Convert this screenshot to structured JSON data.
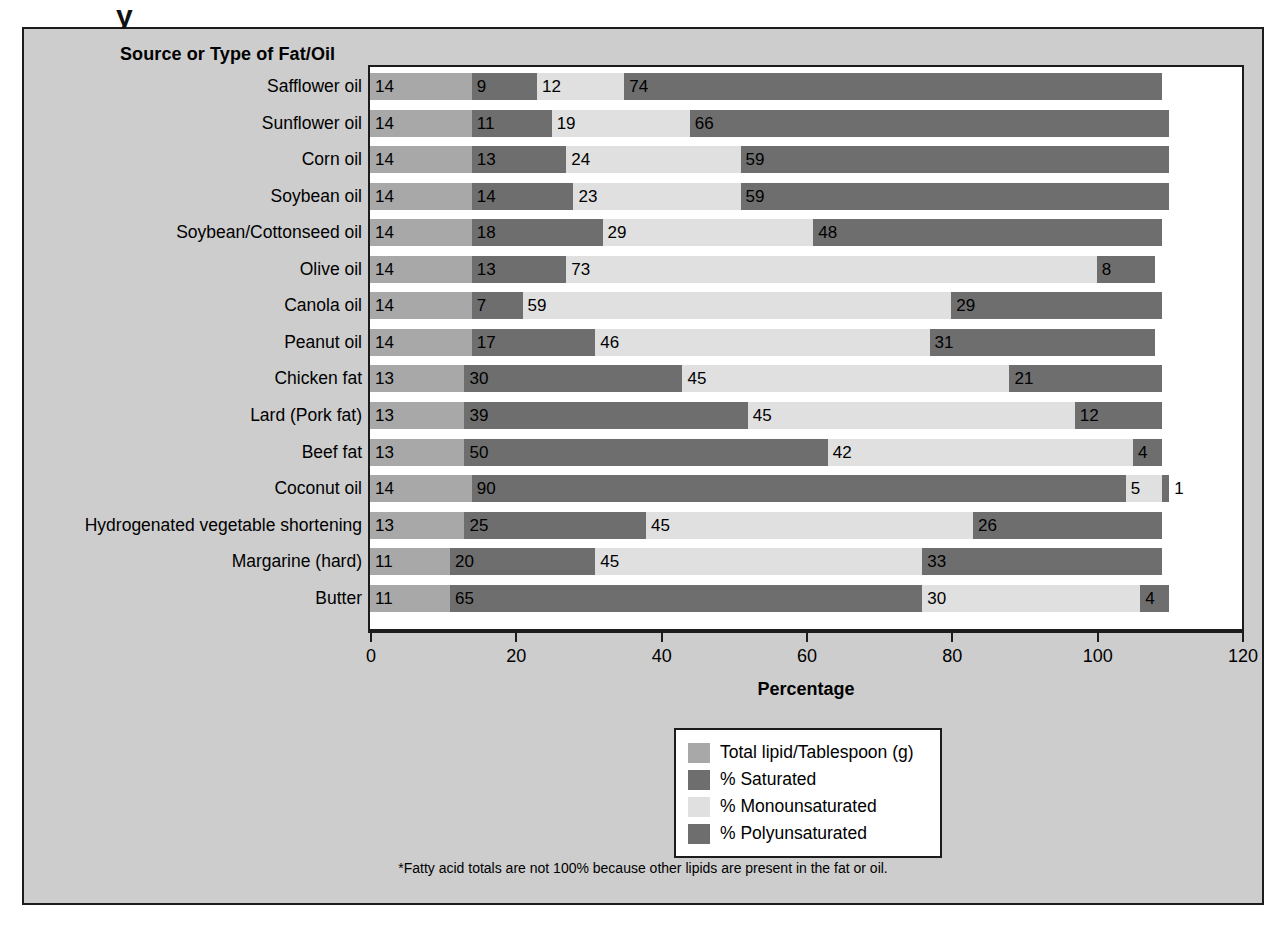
{
  "figure": {
    "column_header": "Source or Type of Fat/Oil",
    "footnote": "*Fatty acid totals are not 100% because other lipids are present in the fat or oil.",
    "title_cut_glyph": "y"
  },
  "legend": {
    "position": "bottom-center",
    "items": [
      {
        "label": "Total lipid/Tablespoon (g)",
        "color": "#a8a8a8",
        "key": "total"
      },
      {
        "label": "% Saturated",
        "color": "#6e6e6e",
        "key": "saturated"
      },
      {
        "label": "% Monounsaturated",
        "color": "#e0e0e0",
        "key": "monounsaturated"
      },
      {
        "label": "% Polyunsaturated",
        "color": "#6e6e6e",
        "key": "polyunsaturated"
      }
    ]
  },
  "colors": {
    "total": "#a8a8a8",
    "saturated": "#6e6e6e",
    "monounsaturated": "#e0e0e0",
    "polyunsaturated": "#6e6e6e",
    "panel_background": "#cdcdcd",
    "plot_background": "#ffffff",
    "frame": "#1c1c1c"
  },
  "chart_data": {
    "type": "bar",
    "orientation": "horizontal",
    "stacked": true,
    "title": "",
    "xlabel": "Percentage",
    "ylabel": "Source or Type of Fat/Oil",
    "xlim": [
      0,
      120
    ],
    "xticks": [
      0,
      20,
      40,
      60,
      80,
      100,
      120
    ],
    "grid": false,
    "legend_position": "bottom-center",
    "categories": [
      "Safflower oil",
      "Sunflower oil",
      "Corn oil",
      "Soybean oil",
      "Soybean/Cottonseed oil",
      "Olive oil",
      "Canola oil",
      "Peanut oil",
      "Chicken fat",
      "Lard (Pork fat)",
      "Beef fat",
      "Coconut oil",
      "Hydrogenated vegetable shortening",
      "Margarine (hard)",
      "Butter"
    ],
    "series": [
      {
        "name": "Total lipid/Tablespoon (g)",
        "key": "total",
        "values": [
          14,
          14,
          14,
          14,
          14,
          14,
          14,
          14,
          13,
          13,
          13,
          14,
          13,
          11,
          11
        ]
      },
      {
        "name": "% Saturated",
        "key": "saturated",
        "values": [
          9,
          11,
          13,
          14,
          18,
          13,
          7,
          17,
          30,
          39,
          50,
          90,
          25,
          20,
          65
        ]
      },
      {
        "name": "% Monounsaturated",
        "key": "monounsaturated",
        "values": [
          12,
          19,
          24,
          23,
          29,
          73,
          59,
          46,
          45,
          45,
          42,
          5,
          45,
          45,
          30
        ]
      },
      {
        "name": "% Polyunsaturated",
        "key": "polyunsaturated",
        "values": [
          74,
          66,
          59,
          59,
          48,
          8,
          29,
          31,
          21,
          12,
          4,
          1,
          26,
          33,
          4
        ]
      }
    ]
  }
}
